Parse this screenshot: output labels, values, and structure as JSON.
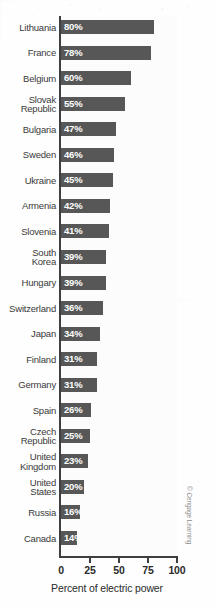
{
  "chart_data": {
    "type": "bar",
    "orientation": "horizontal",
    "title": "",
    "xlabel": "Percent of electric power",
    "ylabel": "",
    "xlim": [
      0,
      100
    ],
    "xticks": [
      0,
      25,
      50,
      75,
      100
    ],
    "xtick_labels": [
      "0",
      "25",
      "50",
      "75",
      "100"
    ],
    "grid": false,
    "legend": false,
    "value_label_suffix": "%",
    "categories": [
      "Lithuania",
      "France",
      "Belgium",
      "Slovak\nRepublic",
      "Bulgaria",
      "Sweden",
      "Ukraine",
      "Armenia",
      "Slovenia",
      "South\nKorea",
      "Hungary",
      "Switzerland",
      "Japan",
      "Finland",
      "Germany",
      "Spain",
      "Czech\nRepublic",
      "United\nKingdom",
      "United\nStates",
      "Russia",
      "Canada"
    ],
    "values": [
      80,
      78,
      60,
      55,
      47,
      46,
      45,
      42,
      41,
      39,
      39,
      36,
      34,
      31,
      31,
      26,
      25,
      23,
      20,
      16,
      14
    ],
    "value_labels": [
      "80%",
      "78%",
      "60%",
      "55%",
      "47%",
      "46%",
      "45%",
      "42%",
      "41%",
      "39%",
      "39%",
      "36%",
      "34%",
      "31%",
      "31%",
      "26%",
      "25%",
      "23%",
      "20%",
      "16%",
      "14%"
    ]
  },
  "colors": {
    "bar": "#575757",
    "axis": "#3f3f3f",
    "label": "#3a3a3a",
    "value": "#ffffff",
    "plot_background": "#fcfcfc",
    "credit": "#8c8c8c"
  },
  "credit": {
    "text": "© Cengage Learning"
  }
}
